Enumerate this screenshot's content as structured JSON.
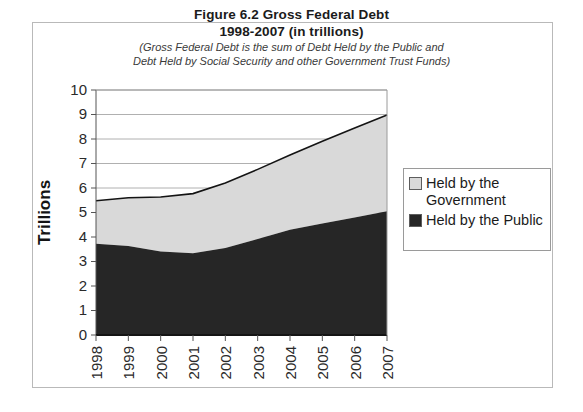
{
  "figure": {
    "title_line1": "Figure 6.2 Gross Federal Debt",
    "title_line2": "1998-2007 (in trillions)",
    "subtitle_line1": "(Gross Federal Debt is the sum of Debt Held by the Public and",
    "subtitle_line2": "Debt Held by Social Security and other Government Trust Funds)"
  },
  "legend": {
    "items": [
      {
        "label": "Held by the Government",
        "color": "#d9d9d9"
      },
      {
        "label": "Held by the Public",
        "color": "#262626"
      }
    ]
  },
  "chart_data": {
    "type": "area",
    "stacked": true,
    "title": "Figure 6.2 Gross Federal Debt 1998-2007 (in trillions)",
    "subtitle": "(Gross Federal Debt is the sum of Debt Held by the Public and Debt Held by Social Security and other Government Trust Funds)",
    "xlabel": "",
    "ylabel": "Trillions",
    "categories": [
      "1998",
      "1999",
      "2000",
      "2001",
      "2002",
      "2003",
      "2004",
      "2005",
      "2006",
      "2007"
    ],
    "series": [
      {
        "name": "Held by the Public",
        "color": "#262626",
        "values": [
          3.72,
          3.63,
          3.41,
          3.34,
          3.55,
          3.92,
          4.3,
          4.55,
          4.8,
          5.05
        ]
      },
      {
        "name": "Held by the Government",
        "color": "#d9d9d9",
        "values": [
          1.76,
          1.97,
          2.22,
          2.43,
          2.65,
          2.84,
          3.05,
          3.36,
          3.65,
          3.93
        ]
      }
    ],
    "totals": [
      5.48,
      5.6,
      5.63,
      5.77,
      6.2,
      6.76,
      7.35,
      7.91,
      8.45,
      8.98
    ],
    "ylim": [
      0,
      10
    ],
    "ytick_labels": [
      "0",
      "1",
      "2",
      "3",
      "4",
      "5",
      "6",
      "7",
      "8",
      "9",
      "10"
    ],
    "ytick_values": [
      0,
      1,
      2,
      3,
      4,
      5,
      6,
      7,
      8,
      9,
      10
    ],
    "grid": true,
    "legend_position": "right"
  }
}
